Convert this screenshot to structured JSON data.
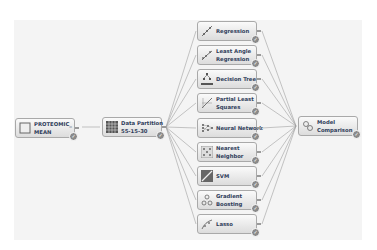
{
  "flow": {
    "source": {
      "label_1": "PROTEOMIC_",
      "label_2": "MEAN"
    },
    "partition": {
      "label_1": "Data Partition",
      "label_2": "55-15-30"
    },
    "models": [
      {
        "label_1": "Regression",
        "label_2": ""
      },
      {
        "label_1": "Least Angle",
        "label_2": "Regression"
      },
      {
        "label_1": "Decision Tree",
        "label_2": ""
      },
      {
        "label_1": "Partial Least",
        "label_2": "Squares"
      },
      {
        "label_1": "Neural Network",
        "label_2": ""
      },
      {
        "label_1": "Nearest",
        "label_2": "Neighbor"
      },
      {
        "label_1": "SVM",
        "label_2": ""
      },
      {
        "label_1": "Gradient",
        "label_2": "Boosting"
      },
      {
        "label_1": "Lasso",
        "label_2": ""
      }
    ],
    "comparison": {
      "label_1": "Model",
      "label_2": "Comparison"
    },
    "status_icon": "checkmark-icon",
    "colors": {
      "wire": "#9b9b9b",
      "label": "#2f3d5a",
      "canvas": "#f4f4f4"
    }
  }
}
